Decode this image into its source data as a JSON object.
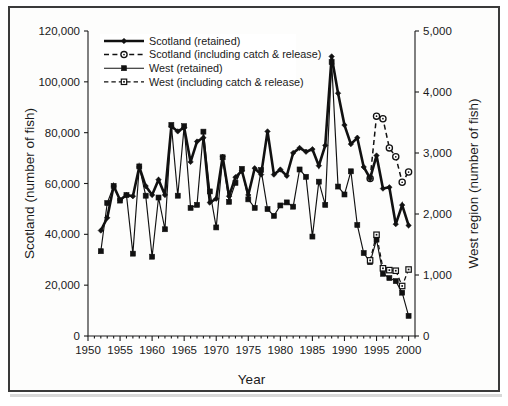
{
  "chart_data": {
    "type": "line",
    "title": "",
    "xlabel": "Year",
    "ylabel_left": "Scotland (number of fish)",
    "ylabel_right": "West region (number of fish)",
    "xlim": [
      1950,
      2001
    ],
    "ylim_left": [
      0,
      120000
    ],
    "ylim_right": [
      0,
      5000
    ],
    "xticks": [
      1950,
      1955,
      1960,
      1965,
      1970,
      1975,
      1980,
      1985,
      1990,
      1995,
      2000
    ],
    "xtick_labels": [
      "1950",
      "1955",
      "1960",
      "1965",
      "1970",
      "1975",
      "1980",
      "1985",
      "1990",
      "1995",
      "2000"
    ],
    "xticks_minor": [
      1951,
      1952,
      1953,
      1954,
      1956,
      1957,
      1958,
      1959,
      1961,
      1962,
      1963,
      1964,
      1966,
      1967,
      1968,
      1969,
      1971,
      1972,
      1973,
      1974,
      1976,
      1977,
      1978,
      1979,
      1981,
      1982,
      1983,
      1984,
      1986,
      1987,
      1988,
      1989,
      1991,
      1992,
      1993,
      1994,
      1996,
      1997,
      1998,
      1999,
      2001
    ],
    "yticks_left": [
      0,
      20000,
      40000,
      60000,
      80000,
      100000,
      120000
    ],
    "ytick_labels_left": [
      "0",
      "20,000",
      "40,000",
      "60,000",
      "80,000",
      "100,000",
      "120,000"
    ],
    "yticks_right": [
      0,
      1000,
      2000,
      3000,
      4000,
      5000
    ],
    "ytick_labels_right": [
      "0",
      "1,000",
      "2,000",
      "3,000",
      "4,000",
      "5,000"
    ],
    "grid": false,
    "legend_position": "top-center-inside",
    "legend": [
      {
        "label": "Scotland (retained)",
        "style": "solid-thick",
        "marker": "diamond-filled",
        "axis": "left"
      },
      {
        "label": "Scotland (including catch & release)",
        "style": "dashed-thin",
        "marker": "circle-open",
        "axis": "left"
      },
      {
        "label": "West (retained)",
        "style": "solid-thin",
        "marker": "square-filled",
        "axis": "right"
      },
      {
        "label": "West (including catch & release)",
        "style": "dashed-thin",
        "marker": "square-open",
        "axis": "right"
      }
    ],
    "series": [
      {
        "name": "Scotland (retained)",
        "axis": "left",
        "x": [
          1952,
          1953,
          1954,
          1955,
          1956,
          1957,
          1958,
          1959,
          1960,
          1961,
          1962,
          1963,
          1964,
          1965,
          1966,
          1967,
          1968,
          1969,
          1970,
          1971,
          1972,
          1973,
          1974,
          1975,
          1976,
          1977,
          1978,
          1979,
          1980,
          1981,
          1982,
          1983,
          1984,
          1985,
          1986,
          1987,
          1988,
          1989,
          1990,
          1991,
          1992,
          1993,
          1994,
          1995,
          1996,
          1997,
          1998,
          1999,
          2000
        ],
        "values": [
          41500,
          46500,
          59000,
          53500,
          55500,
          55000,
          66500,
          59000,
          55500,
          61500,
          55500,
          82500,
          80500,
          82000,
          68500,
          76500,
          78000,
          52500,
          54000,
          70500,
          55000,
          62500,
          65000,
          55500,
          66000,
          63500,
          80500,
          63500,
          65500,
          63000,
          72000,
          74000,
          72500,
          73500,
          67000,
          75000,
          110000,
          95500,
          83000,
          75500,
          78000,
          66500,
          62000,
          71000,
          58000,
          58500,
          44000,
          51500,
          43500
        ]
      },
      {
        "name": "Scotland (including catch & release)",
        "axis": "left",
        "x": [
          1994,
          1995,
          1996,
          1997,
          1998,
          1999,
          2000
        ],
        "values": [
          62000,
          86500,
          85500,
          74000,
          70500,
          60500,
          64500
        ]
      },
      {
        "name": "West (retained)",
        "axis": "right",
        "x": [
          1952,
          1953,
          1954,
          1955,
          1956,
          1957,
          1958,
          1959,
          1960,
          1961,
          1962,
          1963,
          1964,
          1965,
          1966,
          1967,
          1968,
          1969,
          1970,
          1971,
          1972,
          1973,
          1974,
          1975,
          1976,
          1977,
          1978,
          1979,
          1980,
          1981,
          1982,
          1983,
          1984,
          1985,
          1986,
          1987,
          1988,
          1989,
          1990,
          1991,
          1992,
          1993,
          1994,
          1995,
          1996,
          1997,
          1998,
          1999,
          2000
        ],
        "values": [
          1390,
          2180,
          2460,
          2220,
          2310,
          1350,
          2780,
          2300,
          1300,
          2270,
          1750,
          3460,
          2300,
          3440,
          2100,
          2150,
          3350,
          2370,
          1780,
          2930,
          2200,
          2510,
          2740,
          2240,
          2100,
          2720,
          2080,
          1970,
          2140,
          2190,
          2120,
          2730,
          2610,
          1630,
          2530,
          2150,
          4490,
          2450,
          2320,
          2700,
          1820,
          1360,
          1210,
          1580,
          1020,
          950,
          900,
          710,
          330
        ]
      },
      {
        "name": "West (including catch & release)",
        "axis": "right",
        "x": [
          1994,
          1995,
          1996,
          1997,
          1998,
          1999,
          2000
        ],
        "values": [
          1240,
          1660,
          1110,
          1080,
          1070,
          820,
          1090
        ]
      }
    ]
  }
}
